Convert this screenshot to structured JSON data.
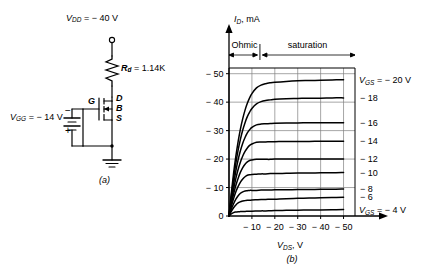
{
  "figure": {
    "panel_a_label": "(a)",
    "panel_b_label": "(b)"
  },
  "circuit": {
    "supply_label_v": "V",
    "supply_label_sub": "DD",
    "supply_label_value": "= − 40 V",
    "resistor_label_v": "R",
    "resistor_label_sub": "d",
    "resistor_label_value": "= 1.14K",
    "gate_supply_v": "V",
    "gate_supply_sub": "GG",
    "gate_supply_value": "= − 14 V",
    "battery_minus": "−",
    "battery_plus": "+",
    "terminal_d": "D",
    "terminal_b": "B",
    "terminal_s": "S",
    "terminal_g": "G"
  },
  "chart_data": {
    "type": "line",
    "title": "",
    "ylabel_symbol": "I",
    "ylabel_sub": "D",
    "ylabel_unit": ", mA",
    "xlabel_symbol": "V",
    "xlabel_sub": "DS",
    "xlabel_unit": ", V",
    "xlim": [
      0,
      -55
    ],
    "ylim": [
      0,
      -52
    ],
    "xticks": [
      -10,
      -20,
      -30,
      -40,
      -50
    ],
    "xtick_labels": [
      "− 10",
      "− 20",
      "− 30",
      "− 40",
      "− 50"
    ],
    "yticks": [
      0,
      -10,
      -20,
      -30,
      -40,
      -50
    ],
    "ytick_labels": [
      "0",
      "− 10",
      "− 20",
      "− 30",
      "− 40",
      "− 50"
    ],
    "grid": true,
    "regions": [
      {
        "name": "Ohmic",
        "from": 0,
        "to": -13
      },
      {
        "name": "saturation",
        "from": -13,
        "to": -52
      }
    ],
    "series": [
      {
        "name": "VGS-20",
        "label": "V_GS = − 20 V",
        "vgs": -20,
        "isat": -47.8,
        "knee": -14.5,
        "x": [
          0,
          -1,
          -2,
          -3,
          -4,
          -5,
          -6,
          -7,
          -8,
          -9,
          -10,
          -12,
          -14,
          -16,
          -18,
          -20,
          -25,
          -30,
          -35,
          -40,
          -45,
          -50
        ],
        "y": [
          0,
          -8.0,
          -15.0,
          -21.0,
          -26.2,
          -30.6,
          -34.2,
          -37.2,
          -39.6,
          -41.5,
          -43.0,
          -45.0,
          -46.0,
          -46.5,
          -46.8,
          -47.0,
          -47.3,
          -47.5,
          -47.6,
          -47.7,
          -47.8,
          -47.9
        ]
      },
      {
        "name": "VGS-18",
        "label": "− 18",
        "vgs": -18,
        "isat": -41.5,
        "knee": -13.0,
        "x": [
          0,
          -1,
          -2,
          -3,
          -4,
          -5,
          -6,
          -7,
          -8,
          -9,
          -10,
          -12,
          -14,
          -16,
          -18,
          -20,
          -25,
          -30,
          -35,
          -40,
          -45,
          -50
        ],
        "y": [
          0,
          -7.0,
          -13.2,
          -18.6,
          -23.2,
          -27.0,
          -30.2,
          -32.8,
          -34.9,
          -36.5,
          -37.8,
          -39.4,
          -40.2,
          -40.6,
          -40.8,
          -41.0,
          -41.2,
          -41.3,
          -41.4,
          -41.4,
          -41.5,
          -41.5
        ]
      },
      {
        "name": "VGS-16",
        "label": "− 16",
        "vgs": -16,
        "isat": -32.8,
        "knee": -11.5,
        "x": [
          0,
          -1,
          -2,
          -3,
          -4,
          -5,
          -6,
          -7,
          -8,
          -9,
          -10,
          -12,
          -14,
          -16,
          -18,
          -20,
          -25,
          -30,
          -35,
          -40,
          -45,
          -50
        ],
        "y": [
          0,
          -6.0,
          -11.3,
          -15.9,
          -19.8,
          -23.0,
          -25.6,
          -27.6,
          -29.2,
          -30.3,
          -31.1,
          -32.0,
          -32.3,
          -32.4,
          -32.5,
          -32.6,
          -32.7,
          -32.7,
          -32.8,
          -32.8,
          -32.8,
          -32.8
        ]
      },
      {
        "name": "VGS-14",
        "label": "− 14",
        "vgs": -14,
        "isat": -26.3,
        "knee": -10.0,
        "x": [
          0,
          -1,
          -2,
          -3,
          -4,
          -5,
          -6,
          -7,
          -8,
          -9,
          -10,
          -12,
          -14,
          -16,
          -18,
          -20,
          -25,
          -30,
          -35,
          -40,
          -45,
          -50
        ],
        "y": [
          0,
          -5.0,
          -9.4,
          -13.2,
          -16.4,
          -19.0,
          -21.1,
          -22.7,
          -23.9,
          -24.8,
          -25.3,
          -25.9,
          -26.0,
          -26.0,
          -26.1,
          -26.1,
          -26.2,
          -26.2,
          -26.2,
          -26.3,
          -26.3,
          -26.3
        ]
      },
      {
        "name": "VGS-12",
        "label": "− 12",
        "vgs": -12,
        "isat": -20.0,
        "knee": -8.5,
        "x": [
          0,
          -1,
          -2,
          -3,
          -4,
          -5,
          -6,
          -7,
          -8,
          -9,
          -10,
          -12,
          -14,
          -16,
          -18,
          -20,
          -25,
          -30,
          -35,
          -40,
          -45,
          -50
        ],
        "y": [
          0,
          -4.1,
          -7.7,
          -10.8,
          -13.3,
          -15.4,
          -17.0,
          -18.2,
          -19.0,
          -19.5,
          -19.7,
          -19.9,
          -19.9,
          -19.9,
          -19.9,
          -20.0,
          -20.0,
          -20.0,
          -20.0,
          -20.0,
          -20.0,
          -20.0
        ]
      },
      {
        "name": "VGS-10",
        "label": "− 10",
        "vgs": -10,
        "isat": -15.3,
        "knee": -7.0,
        "x": [
          0,
          -1,
          -2,
          -3,
          -4,
          -5,
          -6,
          -7,
          -8,
          -9,
          -10,
          -12,
          -14,
          -16,
          -18,
          -20,
          -25,
          -30,
          -35,
          -40,
          -45,
          -50
        ],
        "y": [
          0,
          -3.3,
          -6.1,
          -8.5,
          -10.4,
          -11.9,
          -13.0,
          -13.8,
          -14.3,
          -14.5,
          -14.6,
          -14.7,
          -14.8,
          -14.8,
          -14.9,
          -14.9,
          -15.0,
          -15.1,
          -15.1,
          -15.2,
          -15.2,
          -15.3
        ]
      },
      {
        "name": "VGS-8",
        "label": "− 8",
        "vgs": -8,
        "isat": -9.5,
        "knee": -5.5,
        "x": [
          0,
          -1,
          -2,
          -3,
          -4,
          -5,
          -6,
          -7,
          -8,
          -9,
          -10,
          -12,
          -14,
          -16,
          -18,
          -20,
          -25,
          -30,
          -35,
          -40,
          -45,
          -50
        ],
        "y": [
          0,
          -2.4,
          -4.3,
          -5.9,
          -7.1,
          -8.0,
          -8.5,
          -8.8,
          -8.9,
          -9.0,
          -9.0,
          -9.0,
          -9.1,
          -9.1,
          -9.1,
          -9.2,
          -9.2,
          -9.3,
          -9.3,
          -9.4,
          -9.4,
          -9.5
        ]
      },
      {
        "name": "VGS-6",
        "label": "− 6",
        "vgs": -6,
        "isat": -6.6,
        "knee": -4.0,
        "x": [
          0,
          -1,
          -2,
          -3,
          -4,
          -5,
          -6,
          -7,
          -8,
          -9,
          -10,
          -12,
          -14,
          -16,
          -18,
          -20,
          -25,
          -30,
          -35,
          -40,
          -45,
          -50
        ],
        "y": [
          0,
          -1.6,
          -2.9,
          -3.9,
          -4.6,
          -5.0,
          -5.3,
          -5.4,
          -5.5,
          -5.5,
          -5.6,
          -5.7,
          -5.8,
          -5.8,
          -5.9,
          -5.9,
          -6.1,
          -6.2,
          -6.3,
          -6.4,
          -6.5,
          -6.6
        ]
      },
      {
        "name": "VGS-4",
        "label": "V_GS = − 4 V",
        "vgs": -4,
        "isat": -2.3,
        "knee": -2.5,
        "x": [
          0,
          -1,
          -2,
          -3,
          -4,
          -5,
          -6,
          -7,
          -8,
          -9,
          -10,
          -12,
          -14,
          -16,
          -18,
          -20,
          -25,
          -30,
          -35,
          -40,
          -45,
          -50
        ],
        "y": [
          0,
          -0.7,
          -1.2,
          -1.4,
          -1.5,
          -1.55,
          -1.6,
          -1.6,
          -1.65,
          -1.7,
          -1.7,
          -1.75,
          -1.8,
          -1.8,
          -1.85,
          -1.9,
          -2.0,
          -2.05,
          -2.1,
          -2.15,
          -2.2,
          -2.3
        ]
      }
    ],
    "curve_labels": [
      {
        "symbol": "V",
        "sub": "GS",
        "text": "= − 20 V",
        "y_value": -47.9
      },
      {
        "symbol": "",
        "sub": "",
        "text": "− 18",
        "y_value": -41.5
      },
      {
        "symbol": "",
        "sub": "",
        "text": "− 16",
        "y_value": -32.8
      },
      {
        "symbol": "",
        "sub": "",
        "text": "− 14",
        "y_value": -26.3
      },
      {
        "symbol": "",
        "sub": "",
        "text": "− 12",
        "y_value": -20.0
      },
      {
        "symbol": "",
        "sub": "",
        "text": "− 10",
        "y_value": -15.3
      },
      {
        "symbol": "",
        "sub": "",
        "text": "− 8",
        "y_value": -9.5
      },
      {
        "symbol": "",
        "sub": "",
        "text": "− 6",
        "y_value": -6.6
      },
      {
        "symbol": "V",
        "sub": "GS",
        "text": "= − 4 V",
        "y_value": -2.3
      }
    ]
  }
}
